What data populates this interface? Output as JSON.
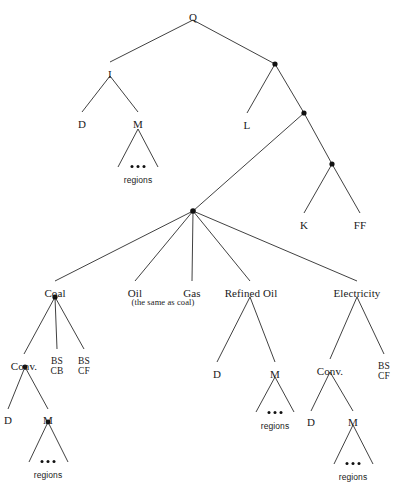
{
  "diagram": {
    "type": "tree",
    "colors": {
      "edge": "#2b2b2b",
      "node": "#111111",
      "text": "#1a1a1a",
      "background": "#ffffff"
    },
    "nodes": [
      {
        "id": "Q",
        "label": "Q",
        "kind": "label",
        "x": 193,
        "y": 12
      },
      {
        "id": "I",
        "label": "I",
        "kind": "label",
        "x": 110,
        "y": 69
      },
      {
        "id": "D1",
        "label": "D",
        "kind": "label",
        "x": 82,
        "y": 119
      },
      {
        "id": "M1",
        "label": "M",
        "kind": "label",
        "x": 138,
        "y": 119
      },
      {
        "id": "regions1",
        "label": "regions",
        "kind": "small",
        "x": 138,
        "y": 176
      },
      {
        "id": "dotA",
        "label": "",
        "kind": "dot",
        "x": 275,
        "y": 64
      },
      {
        "id": "L",
        "label": "L",
        "kind": "label",
        "x": 247,
        "y": 120
      },
      {
        "id": "dotB",
        "label": "",
        "kind": "dot",
        "x": 304,
        "y": 113
      },
      {
        "id": "dotC",
        "label": "",
        "kind": "dot",
        "x": 332,
        "y": 164
      },
      {
        "id": "K",
        "label": "K",
        "kind": "label",
        "x": 304,
        "y": 220
      },
      {
        "id": "FF",
        "label": "FF",
        "kind": "label",
        "x": 360,
        "y": 220
      },
      {
        "id": "fan",
        "label": "",
        "kind": "dot",
        "x": 193,
        "y": 211
      },
      {
        "id": "Coal",
        "label": "Coal",
        "kind": "label",
        "x": 55,
        "y": 288
      },
      {
        "id": "Oil",
        "label": "Oil",
        "kind": "label",
        "x": 135,
        "y": 288
      },
      {
        "id": "OilNote",
        "label": "(the same as coal)",
        "kind": "paren",
        "x": 163,
        "y": 298
      },
      {
        "id": "Gas",
        "label": "Gas",
        "kind": "label",
        "x": 192,
        "y": 288
      },
      {
        "id": "RefinedOil",
        "label": "Refined Oil",
        "kind": "label",
        "x": 251,
        "y": 288
      },
      {
        "id": "Electricity",
        "label": "Electricity",
        "kind": "label",
        "x": 357,
        "y": 288
      },
      {
        "id": "ConvCoal",
        "label": "Conv.",
        "kind": "label",
        "x": 24,
        "y": 361
      },
      {
        "id": "BSCB",
        "label": "BS\nCB",
        "kind": "twoline",
        "x": 57,
        "y": 356
      },
      {
        "id": "BSCF1",
        "label": "BS\nCF",
        "kind": "twoline",
        "x": 84,
        "y": 356
      },
      {
        "id": "D2",
        "label": "D",
        "kind": "label",
        "x": 8,
        "y": 415
      },
      {
        "id": "M2",
        "label": "M",
        "kind": "label",
        "x": 48,
        "y": 415
      },
      {
        "id": "regions2",
        "label": "regions",
        "kind": "small",
        "x": 48,
        "y": 471
      },
      {
        "id": "D3",
        "label": "D",
        "kind": "label",
        "x": 217,
        "y": 369
      },
      {
        "id": "M3",
        "label": "M",
        "kind": "label",
        "x": 275,
        "y": 369
      },
      {
        "id": "regions3",
        "label": "regions",
        "kind": "small",
        "x": 275,
        "y": 422
      },
      {
        "id": "ConvElec",
        "label": "Conv.",
        "kind": "label",
        "x": 330,
        "y": 366
      },
      {
        "id": "BSCF2",
        "label": "BS\nCF",
        "kind": "twoline",
        "x": 384,
        "y": 361
      },
      {
        "id": "D4",
        "label": "D",
        "kind": "label",
        "x": 311,
        "y": 417
      },
      {
        "id": "M4",
        "label": "M",
        "kind": "label",
        "x": 353,
        "y": 417
      },
      {
        "id": "regions4",
        "label": "regions",
        "kind": "small",
        "x": 353,
        "y": 473
      }
    ],
    "edges": [
      {
        "from": "Q",
        "to": "I",
        "path": "M193,20 L110,62"
      },
      {
        "from": "Q",
        "to": "dotA",
        "path": "M193,20 L275,64"
      },
      {
        "from": "I",
        "to": "D1",
        "path": "M110,76 L82,112"
      },
      {
        "from": "I",
        "to": "M1",
        "path": "M110,76 L138,112"
      },
      {
        "from": "M1",
        "to": "region-left",
        "path": "M138,129 L118,167"
      },
      {
        "from": "M1",
        "to": "region-right",
        "path": "M138,129 L158,167"
      },
      {
        "from": "dotA",
        "to": "L",
        "path": "M275,64 L247,113"
      },
      {
        "from": "dotA",
        "to": "dotB",
        "path": "M275,64 L304,113"
      },
      {
        "from": "dotB",
        "to": "fan",
        "path": "M304,113 L193,211"
      },
      {
        "from": "dotB",
        "to": "dotC",
        "path": "M304,113 L332,164"
      },
      {
        "from": "dotC",
        "to": "K",
        "path": "M332,164 L304,213"
      },
      {
        "from": "dotC",
        "to": "FF",
        "path": "M332,164 L360,213"
      },
      {
        "from": "fan",
        "to": "Coal",
        "path": "M193,211 L55,281"
      },
      {
        "from": "fan",
        "to": "Oil",
        "path": "M193,211 L135,281"
      },
      {
        "from": "fan",
        "to": "Gas",
        "path": "M193,211 L192,281"
      },
      {
        "from": "fan",
        "to": "RefinedOil",
        "path": "M193,211 L250,281"
      },
      {
        "from": "fan",
        "to": "Electricity",
        "path": "M193,211 L357,281"
      },
      {
        "from": "Coal",
        "to": "ConvCoal",
        "path": "M55,297 L24,354"
      },
      {
        "from": "Coal",
        "to": "BSCB",
        "path": "M55,297 L57,349"
      },
      {
        "from": "Coal",
        "to": "BSCF1",
        "path": "M55,297 L84,349"
      },
      {
        "from": "ConvCoal",
        "to": "D2",
        "path": "M25,367 L8,409"
      },
      {
        "from": "ConvCoal",
        "to": "M2",
        "path": "M25,367 L48,409"
      },
      {
        "from": "M2",
        "to": "region-left",
        "path": "M48,422 L29,462"
      },
      {
        "from": "M2",
        "to": "region-right",
        "path": "M48,422 L68,462"
      },
      {
        "from": "RefinedOil",
        "to": "D3",
        "path": "M250,297 L217,362"
      },
      {
        "from": "RefinedOil",
        "to": "M3",
        "path": "M250,297 L275,362"
      },
      {
        "from": "M3",
        "to": "region-left",
        "path": "M275,377 L256,412"
      },
      {
        "from": "M3",
        "to": "region-right",
        "path": "M275,377 L294,412"
      },
      {
        "from": "Electricity",
        "to": "ConvElec",
        "path": "M357,297 L330,359"
      },
      {
        "from": "Electricity",
        "to": "BSCF2",
        "path": "M357,297 L384,354"
      },
      {
        "from": "ConvElec",
        "to": "D4",
        "path": "M330,372 L311,411"
      },
      {
        "from": "ConvElec",
        "to": "M4",
        "path": "M330,372 L353,411"
      },
      {
        "from": "M4",
        "to": "region-left",
        "path": "M353,425 L334,464"
      },
      {
        "from": "M4",
        "to": "region-right",
        "path": "M353,425 L373,464"
      }
    ],
    "dots": [
      {
        "x": 275,
        "y": 64,
        "r": 2.6
      },
      {
        "x": 304,
        "y": 113,
        "r": 2.6
      },
      {
        "x": 332,
        "y": 164,
        "r": 2.6
      },
      {
        "x": 193,
        "y": 211,
        "r": 2.8
      },
      {
        "x": 55,
        "y": 297,
        "r": 2.6
      },
      {
        "x": 25,
        "y": 367,
        "r": 2.4
      },
      {
        "x": 48,
        "y": 422,
        "r": 2.4
      }
    ],
    "ellipses": [
      {
        "id": "ell1",
        "x": 138,
        "y": 165
      },
      {
        "id": "ell2",
        "x": 48,
        "y": 460
      },
      {
        "id": "ell3",
        "x": 275,
        "y": 411
      },
      {
        "id": "ell4",
        "x": 353,
        "y": 462
      }
    ]
  }
}
